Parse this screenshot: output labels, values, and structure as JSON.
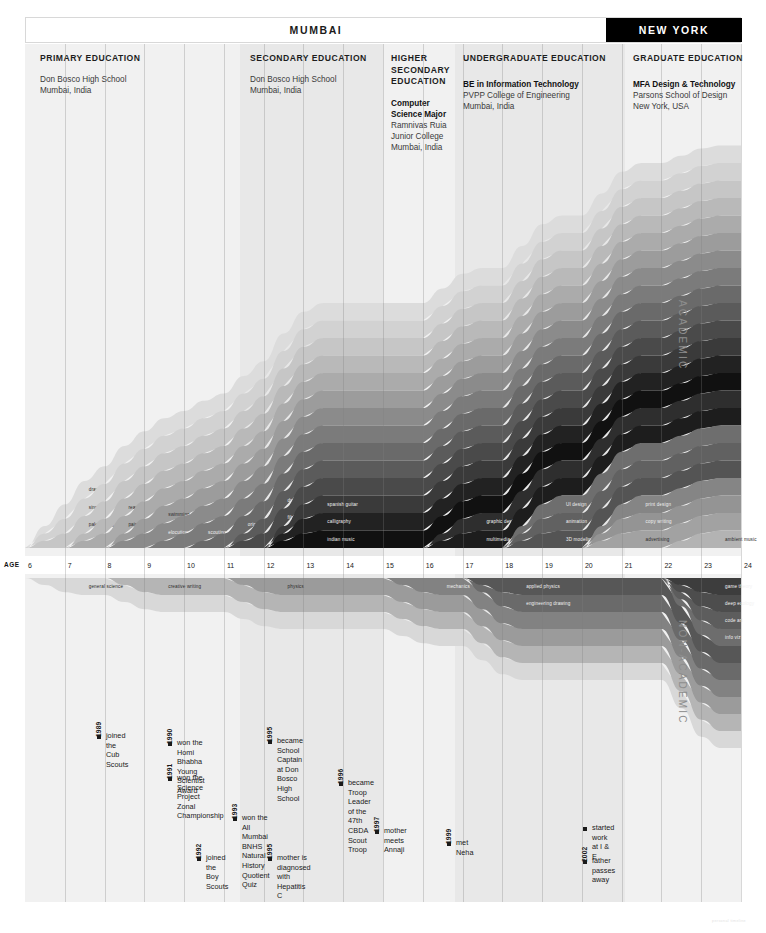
{
  "header": {
    "locations": [
      {
        "name": "MUMBAI",
        "style": "light"
      },
      {
        "name": "NEW YORK",
        "style": "dark"
      }
    ]
  },
  "education_phases": [
    {
      "title": "PRIMARY EDUCATION",
      "school": "Don Bosco High School",
      "place": "Mumbai, India",
      "degree": "",
      "degree_school": "",
      "degree_place": ""
    },
    {
      "title": "SECONDARY EDUCATION",
      "school": "Don Bosco High School",
      "place": "Mumbai, India",
      "degree": "",
      "degree_school": "",
      "degree_place": ""
    },
    {
      "title": "HIGHER SECONDARY EDUCATION",
      "school": "",
      "place": "",
      "degree": "Computer Science Major",
      "degree_school": "Ramnivas Ruia Junior College",
      "degree_place": "Mumbai, India"
    },
    {
      "title": "UNDERGRADUATE EDUCATION",
      "school": "",
      "place": "",
      "degree": "BE in Information Technology",
      "degree_school": "PVPP College of Engineering",
      "degree_place": "Mumbai, India"
    },
    {
      "title": "GRADUATE EDUCATION",
      "school": "",
      "place": "",
      "degree": "MFA Design & Technology",
      "degree_school": "Parsons School of Design",
      "degree_place": "New York, USA"
    }
  ],
  "axis": {
    "label": "AGE",
    "ticks": [
      6,
      7,
      8,
      9,
      10,
      11,
      12,
      13,
      14,
      15,
      16,
      17,
      18,
      19,
      20,
      21,
      22,
      23,
      24
    ],
    "min": 6,
    "max": 24
  },
  "side_labels": {
    "academic": "ACADEMIC",
    "non_academic": "NON-ACADEMIC"
  },
  "chart_data": {
    "type": "area",
    "xlabel": "AGE",
    "ylabel": "",
    "xlim": [
      6,
      24
    ],
    "grid": false,
    "academic_streams": [
      {
        "name": "drawing",
        "color": "#dcdcdc",
        "start": 6,
        "end": 24
      },
      {
        "name": "singing",
        "color": "#d2d2d2",
        "start": 6,
        "end": 24
      },
      {
        "name": "paleontology",
        "color": "#c6c6c6",
        "start": 6,
        "end": 24
      },
      {
        "name": "reading",
        "color": "#b9b9b9",
        "start": 7,
        "end": 24
      },
      {
        "name": "painting",
        "color": "#ababab",
        "start": 7,
        "end": 24
      },
      {
        "name": "swimming",
        "color": "#9c9c9c",
        "start": 8,
        "end": 24
      },
      {
        "name": "elocution",
        "color": "#8b8b8b",
        "start": 8,
        "end": 24
      },
      {
        "name": "scouting",
        "color": "#7b7b7b",
        "start": 9,
        "end": 24
      },
      {
        "name": "origami",
        "color": "#6a6a6a",
        "start": 10,
        "end": 24
      },
      {
        "name": "drums",
        "color": "#5b5b5b",
        "start": 11,
        "end": 24
      },
      {
        "name": "film",
        "color": "#4a4a4a",
        "start": 11,
        "end": 24
      },
      {
        "name": "spanish guitar",
        "color": "#3a3a3a",
        "start": 12,
        "end": 24
      },
      {
        "name": "calligraphy",
        "color": "#222222",
        "start": 12,
        "end": 24
      },
      {
        "name": "indian music",
        "color": "#111111",
        "start": 12,
        "end": 24
      },
      {
        "name": "graphic design",
        "color": "#2e2e2e",
        "start": 16,
        "end": 24
      },
      {
        "name": "multimedia",
        "color": "#1d1d1d",
        "start": 16,
        "end": 24
      },
      {
        "name": "UI design",
        "color": "#6e6e6e",
        "start": 18,
        "end": 24
      },
      {
        "name": "animation",
        "color": "#616161",
        "start": 18,
        "end": 24
      },
      {
        "name": "3D modeling",
        "color": "#545454",
        "start": 18,
        "end": 24
      },
      {
        "name": "print design",
        "color": "#858585",
        "start": 20,
        "end": 24
      },
      {
        "name": "copy writing",
        "color": "#949494",
        "start": 20,
        "end": 24
      },
      {
        "name": "advertising",
        "color": "#a2a2a2",
        "start": 20,
        "end": 24
      },
      {
        "name": "ambient music",
        "color": "#b3b3b3",
        "start": 22,
        "end": 24
      }
    ],
    "non_academic_streams": [
      {
        "name": "general science",
        "color": "#d8d8d8",
        "start": 6,
        "end": 24
      },
      {
        "name": "creative writing",
        "color": "#b5b5b5",
        "start": 8,
        "end": 24
      },
      {
        "name": "physics",
        "color": "#9b9b9b",
        "start": 11,
        "end": 24
      },
      {
        "name": "mechanics",
        "color": "#828282",
        "start": 15,
        "end": 24
      },
      {
        "name": "engineering drawing",
        "color": "#6a6a6a",
        "start": 17,
        "end": 24
      },
      {
        "name": "applied physics",
        "color": "#575757",
        "start": 17,
        "end": 24
      },
      {
        "name": "info viz",
        "color": "#6d6d6d",
        "start": 22,
        "end": 24
      },
      {
        "name": "code art",
        "color": "#5d5d5d",
        "start": 22,
        "end": 24
      },
      {
        "name": "deep ecology",
        "color": "#4d4d4d",
        "start": 22,
        "end": 24
      },
      {
        "name": "game theory",
        "color": "#3d3d3d",
        "start": 22,
        "end": 24
      }
    ]
  },
  "events": [
    {
      "year": "1989",
      "text": "joined the\nCub Scouts"
    },
    {
      "year": "1990",
      "text": "won the Homi Bhabha\nYoung Scientist Award"
    },
    {
      "year": "1991",
      "text": "won the Science Project\nZonal Championship"
    },
    {
      "year": "1992",
      "text": "joined the\nBoy Scouts"
    },
    {
      "year": "1993",
      "text": "won the All Mumbai BNHS\nNatural History Quotient Quiz"
    },
    {
      "year": "1995",
      "text": "became School Captain\nat Don Bosco High School"
    },
    {
      "year": "1995",
      "text": "mother is diagnosed\nwith Hepatitis C"
    },
    {
      "year": "1996",
      "text": "became Troop Leader\nof the 47th CBDA\nScout Troop"
    },
    {
      "year": "1997",
      "text": "mother meets\nAnnaji"
    },
    {
      "year": "1999",
      "text": "met Neha"
    },
    {
      "year": "",
      "text": "started work\nat I & E"
    },
    {
      "year": "2002",
      "text": "father\npasses away"
    }
  ],
  "footer": {
    "note": "personal timeline"
  }
}
